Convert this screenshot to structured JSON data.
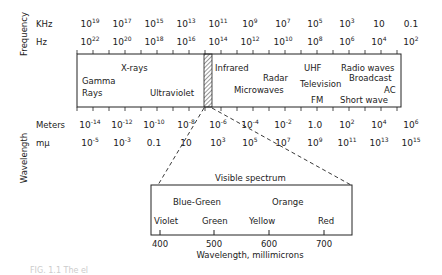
{
  "axis_labels": {
    "frequency": "Frequency",
    "wavelength": "Wavelength",
    "khz": "KHz",
    "hz": "Hz",
    "meters": "Meters",
    "mmu": "mμ"
  },
  "khz_ticks": [
    {
      "b": "10",
      "e": "19"
    },
    {
      "b": "10",
      "e": "17"
    },
    {
      "b": "10",
      "e": "15"
    },
    {
      "b": "10",
      "e": "13"
    },
    {
      "b": "10",
      "e": "11"
    },
    {
      "b": "10",
      "e": "9"
    },
    {
      "b": "10",
      "e": "7"
    },
    {
      "b": "10",
      "e": "5"
    },
    {
      "b": "10",
      "e": "3"
    },
    {
      "b": "10",
      "e": ""
    },
    {
      "b": "0.1",
      "e": ""
    }
  ],
  "hz_ticks": [
    {
      "b": "10",
      "e": "22"
    },
    {
      "b": "10",
      "e": "20"
    },
    {
      "b": "10",
      "e": "18"
    },
    {
      "b": "10",
      "e": "16"
    },
    {
      "b": "10",
      "e": "14"
    },
    {
      "b": "10",
      "e": "12"
    },
    {
      "b": "10",
      "e": "10"
    },
    {
      "b": "10",
      "e": "8"
    },
    {
      "b": "10",
      "e": "6"
    },
    {
      "b": "10",
      "e": "4"
    },
    {
      "b": "10",
      "e": "2"
    }
  ],
  "meter_ticks": [
    {
      "b": "10",
      "e": "-14"
    },
    {
      "b": "10",
      "e": "-12"
    },
    {
      "b": "10",
      "e": "-10"
    },
    {
      "b": "10",
      "e": "-8"
    },
    {
      "b": "10",
      "e": "-6"
    },
    {
      "b": "10",
      "e": "-4"
    },
    {
      "b": "10",
      "e": "-2"
    },
    {
      "b": "1.0",
      "e": ""
    },
    {
      "b": "10",
      "e": "2"
    },
    {
      "b": "10",
      "e": "4"
    },
    {
      "b": "10",
      "e": "6"
    }
  ],
  "mmu_ticks": [
    {
      "b": "10",
      "e": "-5"
    },
    {
      "b": "10",
      "e": "-3"
    },
    {
      "b": "0.1",
      "e": ""
    },
    {
      "b": "10",
      "e": ""
    },
    {
      "b": "10",
      "e": "3"
    },
    {
      "b": "10",
      "e": "5"
    },
    {
      "b": "10",
      "e": "7"
    },
    {
      "b": "10",
      "e": "9"
    },
    {
      "b": "10",
      "e": "11"
    },
    {
      "b": "10",
      "e": "13"
    },
    {
      "b": "10",
      "e": "15"
    }
  ],
  "bands": {
    "gamma1": "Gamma",
    "gamma2": "Rays",
    "xrays": "X-rays",
    "ultraviolet": "Ultraviolet",
    "infrared": "Infrared",
    "radar": "Radar",
    "microwaves": "Microwaves",
    "uhf": "UHF",
    "television": "Television",
    "fm": "FM",
    "radio": "Radio waves",
    "broadcast": "Broadcast",
    "shortwave": "Short wave",
    "ac": "AC"
  },
  "visible": {
    "title": "Visible spectrum",
    "blue_green": "Blue-Green",
    "orange": "Orange",
    "violet": "Violet",
    "green": "Green",
    "yellow": "Yellow",
    "red": "Red",
    "ticks": [
      "400",
      "500",
      "600",
      "700"
    ],
    "axis_label": "Wavelength, millimicrons"
  },
  "caption": "FIG. 1.1 The el"
}
